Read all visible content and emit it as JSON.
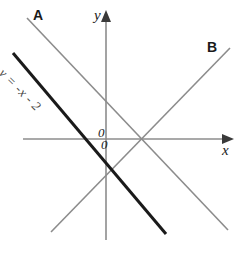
{
  "figure": {
    "width": 244,
    "height": 256,
    "background_color": "#ffffff"
  },
  "axes": {
    "x_axis_label": "x",
    "y_axis_label": "y",
    "origin_label_upper": "0",
    "origin_label_lower": "0",
    "axis_color": "#8c8c8c",
    "x_axis": {
      "x1": 23,
      "y1": 139,
      "x2": 228,
      "y2": 139,
      "arrow": "right"
    },
    "y_axis": {
      "x1": 106,
      "y1": 240,
      "x2": 106,
      "y2": 14,
      "arrow": "up"
    }
  },
  "lines": [
    {
      "name": "line-A",
      "label": "A",
      "color": "#8c8c8c",
      "width": 1.6,
      "x1": 27,
      "y1": 18,
      "x2": 228,
      "y2": 230,
      "label_x": 33,
      "label_y": 8
    },
    {
      "name": "line-B",
      "label": "B",
      "color": "#8c8c8c",
      "width": 1.6,
      "x1": 51,
      "y1": 232,
      "x2": 230,
      "y2": 48,
      "label_x": 207,
      "label_y": 40
    },
    {
      "name": "line-equation",
      "label": "y = -x - 2",
      "color": "#1a1a1a",
      "width": 3.0,
      "x1": 13,
      "y1": 53,
      "x2": 166,
      "y2": 234,
      "label_x": 6,
      "label_y": 66,
      "label_rotation_deg": 45
    }
  ],
  "equation": {
    "text": "y = -x - 2"
  }
}
